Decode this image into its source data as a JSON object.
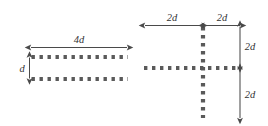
{
  "figure": {
    "background_color": "#ffffff",
    "dot_color": "#5a5a5a",
    "arrow_color": "#4a4a4a",
    "label_color": "#333333",
    "left_diagram": {
      "name": "parallel-dotted-lines",
      "labels": {
        "length": "4d",
        "separation": "d"
      },
      "dotted_rows": 2,
      "dimension_arrows": [
        {
          "label": "4d",
          "orientation": "horizontal",
          "heads": "both"
        },
        {
          "label": "d",
          "orientation": "vertical",
          "heads": "both"
        }
      ]
    },
    "right_diagram": {
      "name": "dotted-cross",
      "labels": {
        "left_span": "2d",
        "right_span": "2d",
        "upper_span": "2d",
        "lower_span": "2d"
      },
      "dimension_arrows": [
        {
          "label": "2d",
          "orientation": "horizontal",
          "heads": "both"
        },
        {
          "label": "2d",
          "orientation": "horizontal",
          "heads": "both"
        },
        {
          "label": "2d",
          "orientation": "vertical",
          "heads": "both"
        },
        {
          "label": "2d",
          "orientation": "vertical",
          "heads": "both"
        }
      ]
    }
  }
}
